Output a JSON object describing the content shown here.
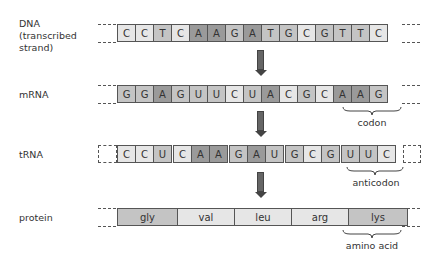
{
  "labels": {
    "dna_line1": "DNA",
    "dna_line2": "(transcribed",
    "dna_line3": "strand)",
    "mrna": "mRNA",
    "trna": "tRNA",
    "protein": "protein"
  },
  "dna": [
    {
      "b": "C",
      "shade": "light"
    },
    {
      "b": "C",
      "shade": "light"
    },
    {
      "b": "T",
      "shade": "mid"
    },
    {
      "b": "C",
      "shade": "light"
    },
    {
      "b": "A",
      "shade": "dark"
    },
    {
      "b": "A",
      "shade": "dark"
    },
    {
      "b": "G",
      "shade": "mid"
    },
    {
      "b": "A",
      "shade": "dark"
    },
    {
      "b": "T",
      "shade": "mid"
    },
    {
      "b": "G",
      "shade": "mid"
    },
    {
      "b": "C",
      "shade": "light"
    },
    {
      "b": "G",
      "shade": "mid"
    },
    {
      "b": "T",
      "shade": "mid"
    },
    {
      "b": "T",
      "shade": "mid"
    },
    {
      "b": "C",
      "shade": "light"
    }
  ],
  "mrna": [
    {
      "b": "G",
      "shade": "mid"
    },
    {
      "b": "G",
      "shade": "mid"
    },
    {
      "b": "A",
      "shade": "dark"
    },
    {
      "b": "G",
      "shade": "mid"
    },
    {
      "b": "U",
      "shade": "mid"
    },
    {
      "b": "U",
      "shade": "mid"
    },
    {
      "b": "C",
      "shade": "light"
    },
    {
      "b": "U",
      "shade": "mid"
    },
    {
      "b": "A",
      "shade": "dark"
    },
    {
      "b": "C",
      "shade": "light"
    },
    {
      "b": "G",
      "shade": "mid"
    },
    {
      "b": "C",
      "shade": "light"
    },
    {
      "b": "A",
      "shade": "dark"
    },
    {
      "b": "A",
      "shade": "dark"
    },
    {
      "b": "G",
      "shade": "mid"
    }
  ],
  "trna": [
    [
      {
        "b": "C",
        "shade": "light"
      },
      {
        "b": "C",
        "shade": "light"
      },
      {
        "b": "U",
        "shade": "mid"
      }
    ],
    [
      {
        "b": "C",
        "shade": "light"
      },
      {
        "b": "A",
        "shade": "dark"
      },
      {
        "b": "A",
        "shade": "dark"
      }
    ],
    [
      {
        "b": "G",
        "shade": "mid"
      },
      {
        "b": "A",
        "shade": "dark"
      },
      {
        "b": "U",
        "shade": "mid"
      }
    ],
    [
      {
        "b": "G",
        "shade": "mid"
      },
      {
        "b": "C",
        "shade": "light"
      },
      {
        "b": "G",
        "shade": "mid"
      }
    ],
    [
      {
        "b": "U",
        "shade": "mid"
      },
      {
        "b": "U",
        "shade": "mid"
      },
      {
        "b": "C",
        "shade": "light"
      }
    ]
  ],
  "protein": [
    {
      "name": "gly",
      "shade": "mid"
    },
    {
      "name": "val",
      "shade": "light"
    },
    {
      "name": "leu",
      "shade": "light"
    },
    {
      "name": "arg",
      "shade": "light"
    },
    {
      "name": "lys",
      "shade": "mid"
    }
  ],
  "annotations": {
    "codon": "codon",
    "anticodon": "anticodon",
    "amino_acid": "amino acid"
  },
  "colors": {
    "light": "#e6e6e6",
    "mid": "#c4c4c4",
    "dark": "#9a9a9a",
    "arrow": "#666666"
  }
}
